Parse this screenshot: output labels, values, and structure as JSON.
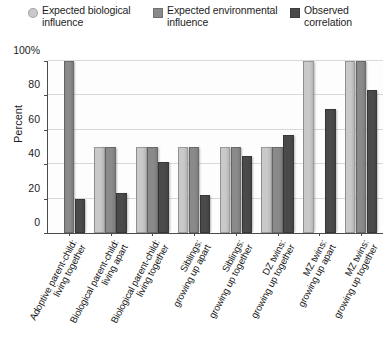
{
  "chart_data": {
    "type": "bar",
    "title": "",
    "subtitle": "",
    "xlabel": "",
    "ylabel": "Percent",
    "ylim": [
      0,
      100
    ],
    "yticks": [
      "0",
      "20",
      "40",
      "60",
      "80",
      "100%"
    ],
    "ytick_values": [
      0,
      20,
      40,
      60,
      80,
      100
    ],
    "grid": true,
    "legend_position": "top",
    "categories": [
      "Adoptive parent-child:\nliving together",
      "Biological parent-child:\nliving apart",
      "Biological parent-child:\nliving together",
      "Siblings:\ngrowing up apart",
      "Siblings:\ngrowing up together",
      "DZ twins:\ngrowing up together",
      "MZ twins:\ngrowing up apart",
      "MZ twins:\ngrowing up together"
    ],
    "series": [
      {
        "name": "Expected biological influence",
        "color": "#c9c9c9",
        "values": [
          0,
          50,
          50,
          50,
          50,
          50,
          100,
          100
        ]
      },
      {
        "name": "Expected environmental influence",
        "color": "#8a8a8a",
        "values": [
          100,
          50,
          50,
          50,
          50,
          50,
          0,
          100
        ]
      },
      {
        "name": "Observed correlation",
        "color": "#4a4a4a",
        "values": [
          20,
          23,
          41,
          22,
          45,
          57,
          72,
          83
        ]
      }
    ]
  },
  "legend": {
    "items": [
      {
        "label": "Expected biological\ninfluence",
        "color": "#c9c9c9",
        "marker": "round"
      },
      {
        "label": "Expected environmental\ninfluence",
        "color": "#8a8a8a",
        "marker": "square"
      },
      {
        "label": "Observed\ncorrelation",
        "color": "#4a4a4a",
        "marker": "square"
      }
    ]
  },
  "axis": {
    "y_title": "Percent",
    "y_ticks": [
      "100%",
      "80",
      "60",
      "40",
      "20",
      "0"
    ]
  },
  "colors": {
    "biological": "#c9c9c9",
    "environmental": "#8a8a8a",
    "observed": "#4a4a4a",
    "axis": "#4b4b4b",
    "grid": "#d8d8d8",
    "background": "#ffffff"
  }
}
